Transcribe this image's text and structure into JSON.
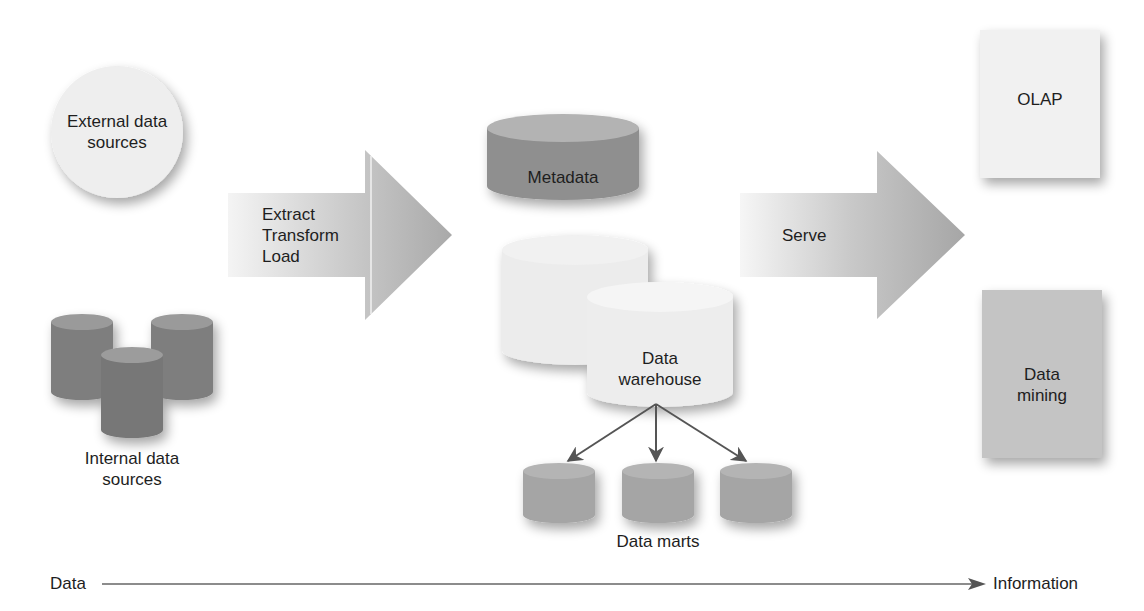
{
  "diagram": {
    "external_sources": {
      "label_line1": "External data",
      "label_line2": "sources",
      "shape": "circle"
    },
    "internal_sources": {
      "label_line1": "Internal data",
      "label_line2": "sources",
      "shape": "cylinder-group",
      "count": 3
    },
    "etl_arrow": {
      "line1": "Extract",
      "line2": "Transform",
      "line3": "Load"
    },
    "metadata": {
      "label": "Metadata",
      "shape": "cylinder"
    },
    "data_warehouse": {
      "label_line1": "Data",
      "label_line2": "warehouse",
      "shape": "cylinder-stack"
    },
    "data_marts": {
      "label": "Data marts",
      "count": 3
    },
    "serve_arrow": {
      "label": "Serve"
    },
    "olap": {
      "label": "OLAP",
      "shape": "document"
    },
    "data_mining": {
      "label_line1": "Data",
      "label_line2": "mining",
      "shape": "document"
    },
    "axis": {
      "start": "Data",
      "end": "Information"
    }
  },
  "colors": {
    "dark_cylinder": "#7e7e7e",
    "dark_cylinder_top": "#9a9a9a",
    "metadata_side": "#8f8f8f",
    "metadata_top": "#b3b3b3",
    "light_shape": "#eeeeee",
    "arrow_fill": "#a8a8a8",
    "mart_fill": "#a5a5a5",
    "data_mining_fill": "#c4c4c4",
    "line": "#555555"
  }
}
